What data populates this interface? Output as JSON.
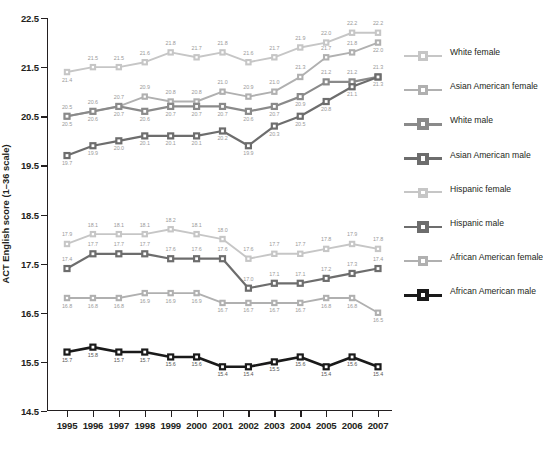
{
  "chart_data": {
    "type": "line",
    "title": "",
    "xlabel": "",
    "ylabel": "ACT English score (1–36 scale)",
    "x": [
      1995,
      1996,
      1997,
      1998,
      1999,
      2000,
      2001,
      2002,
      2003,
      2004,
      2005,
      2006,
      2007
    ],
    "xticklabels": [
      "1995",
      "1996",
      "1997",
      "1998",
      "1999",
      "2000",
      "2001",
      "2002",
      "2003",
      "2004",
      "2005",
      "2006",
      "2007"
    ],
    "ylim": [
      14.5,
      22.5
    ],
    "yticks": [
      14.5,
      15.5,
      16.5,
      17.5,
      18.5,
      19.5,
      20.5,
      21.5,
      22.5
    ],
    "yticklabels": [
      "14.5",
      "15.5",
      "16.5",
      "17.5",
      "18.5",
      "19.5",
      "20.5",
      "21.5",
      "22.5"
    ],
    "grid": false,
    "legend_position": "right",
    "series": [
      {
        "name": "White female",
        "color": "#c6c6c6",
        "values": [
          21.4,
          21.5,
          21.5,
          21.6,
          21.8,
          21.7,
          21.8,
          21.6,
          21.7,
          21.9,
          22.0,
          22.2,
          22.2
        ],
        "labels": [
          "21.4",
          "21.5",
          "21.5",
          "21.6",
          "21.8",
          "21.7",
          "21.8",
          "21.6",
          "21.7",
          "21.9",
          "22.0",
          "22.2",
          "22.2"
        ],
        "label_side": [
          "below",
          "above",
          "above",
          "above",
          "above",
          "above",
          "above",
          "above",
          "above",
          "above",
          "above",
          "above",
          "above"
        ]
      },
      {
        "name": "Asian American female",
        "color": "#b0b0b0",
        "values": [
          20.5,
          20.6,
          20.7,
          20.9,
          20.8,
          20.8,
          21.0,
          20.9,
          21.0,
          21.3,
          21.7,
          21.8,
          22.0
        ],
        "labels": [
          "20.5",
          "20.6",
          "20.7",
          "20.9",
          "20.8",
          "20.8",
          "21.0",
          "20.9",
          "21.0",
          "21.3",
          "21.7",
          "21.8",
          "22.0"
        ],
        "label_side": [
          "above",
          "above",
          "above",
          "above",
          "above",
          "above",
          "above",
          "above",
          "above",
          "above",
          "above",
          "above",
          "below"
        ]
      },
      {
        "name": "White male",
        "color": "#8a8a8a",
        "values": [
          20.5,
          20.6,
          20.7,
          20.6,
          20.7,
          20.7,
          20.7,
          20.6,
          20.7,
          20.9,
          21.2,
          21.2,
          21.3
        ],
        "labels": [
          "20.5",
          "20.6",
          "20.7",
          "20.6",
          "20.7",
          "20.7",
          "20.7",
          "20.6",
          "20.7",
          "20.9",
          "21.2",
          "21.2",
          "21.3"
        ],
        "label_side": [
          "below",
          "below",
          "below",
          "below",
          "below",
          "below",
          "below",
          "below",
          "below",
          "below",
          "above",
          "above",
          "above"
        ]
      },
      {
        "name": "Asian American male",
        "color": "#6d6d6d",
        "values": [
          19.7,
          19.9,
          20.0,
          20.1,
          20.1,
          20.1,
          20.2,
          19.9,
          20.3,
          20.5,
          20.8,
          21.1,
          21.3
        ],
        "labels": [
          "19.7",
          "19.9",
          "20.0",
          "20.1",
          "20.1",
          "20.1",
          "20.2",
          "19.9",
          "20.3",
          "20.5",
          "20.8",
          "21.1",
          "21.3"
        ],
        "label_side": [
          "below",
          "below",
          "below",
          "below",
          "below",
          "below",
          "below",
          "below",
          "below",
          "below",
          "below",
          "below",
          "below"
        ]
      },
      {
        "name": "Hispanic female",
        "color": "#c6c6c6",
        "values": [
          17.9,
          18.1,
          18.1,
          18.1,
          18.2,
          18.1,
          18.0,
          17.6,
          17.7,
          17.7,
          17.8,
          17.9,
          17.8
        ],
        "labels": [
          "17.9",
          "18.1",
          "18.1",
          "18.1",
          "18.2",
          "18.1",
          "18.0",
          "17.6",
          "17.7",
          "17.7",
          "17.8",
          "17.9",
          "17.8"
        ],
        "label_side": [
          "above",
          "above",
          "above",
          "above",
          "above",
          "above",
          "above",
          "above",
          "above",
          "above",
          "above",
          "above",
          "above"
        ]
      },
      {
        "name": "Hispanic male",
        "color": "#6d6d6d",
        "values": [
          17.4,
          17.7,
          17.7,
          17.7,
          17.6,
          17.6,
          17.6,
          17.0,
          17.1,
          17.1,
          17.2,
          17.3,
          17.4
        ],
        "labels": [
          "17.4",
          "17.7",
          "17.7",
          "17.7",
          "17.6",
          "17.6",
          "17.6",
          "17.0",
          "17.1",
          "17.1",
          "17.2",
          "17.3",
          "17.4"
        ],
        "label_side": [
          "above",
          "above",
          "above",
          "above",
          "above",
          "above",
          "above",
          "above",
          "above",
          "above",
          "above",
          "above",
          "above"
        ]
      },
      {
        "name": "African American female",
        "color": "#b0b0b0",
        "values": [
          16.8,
          16.8,
          16.8,
          16.9,
          16.9,
          16.9,
          16.7,
          16.7,
          16.7,
          16.7,
          16.8,
          16.8,
          16.5
        ],
        "labels": [
          "16.8",
          "16.8",
          "16.8",
          "16.9",
          "16.9",
          "16.9",
          "16.7",
          "16.7",
          "16.7",
          "16.7",
          "16.8",
          "16.8",
          "16.5"
        ],
        "label_side": [
          "below",
          "below",
          "below",
          "below",
          "below",
          "below",
          "below",
          "below",
          "below",
          "below",
          "below",
          "below",
          "below"
        ]
      },
      {
        "name": "African American male",
        "color": "#1a1a1a",
        "values": [
          15.7,
          15.8,
          15.7,
          15.7,
          15.6,
          15.6,
          15.4,
          15.4,
          15.5,
          15.6,
          15.4,
          15.6,
          15.4
        ],
        "labels": [
          "15.7",
          "15.8",
          "15.7",
          "15.7",
          "15.6",
          "15.6",
          "15.4",
          "15.4",
          "15.5",
          "15.6",
          "15.4",
          "15.6",
          "15.4"
        ],
        "label_side": [
          "below",
          "below",
          "below",
          "below",
          "below",
          "below",
          "below",
          "below",
          "below",
          "below",
          "below",
          "below",
          "below"
        ]
      }
    ]
  },
  "legend": {
    "items": [
      {
        "label": "White female",
        "color": "#c6c6c6"
      },
      {
        "label": "Asian American female",
        "color": "#b0b0b0"
      },
      {
        "label": "White male",
        "color": "#8a8a8a"
      },
      {
        "label": "Asian American male",
        "color": "#6d6d6d"
      },
      {
        "label": "Hispanic female",
        "color": "#c6c6c6"
      },
      {
        "label": "Hispanic male",
        "color": "#6d6d6d"
      },
      {
        "label": "African American female",
        "color": "#b0b0b0"
      },
      {
        "label": "African American male",
        "color": "#1a1a1a"
      }
    ]
  }
}
